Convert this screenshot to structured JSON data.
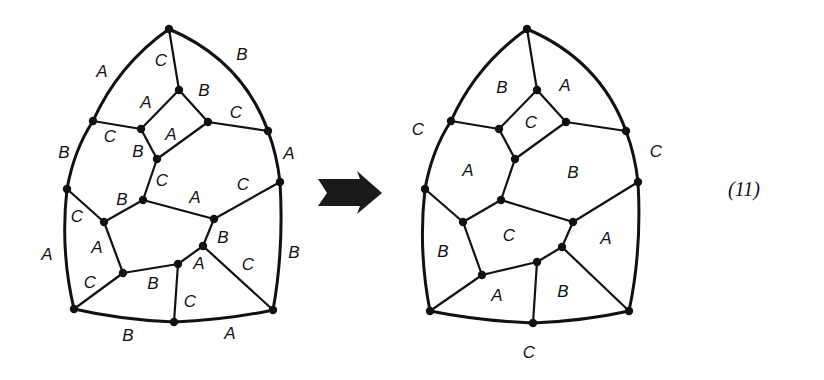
{
  "equation_label": "(11)",
  "arrow": {
    "direction": "right",
    "style": "stippled-block-arrow"
  },
  "left_diagram": {
    "description": "3-edge-colored cubic planar map; labels mark edge colors",
    "nodes": {
      "top": [
        169,
        29
      ],
      "it": [
        179,
        90
      ],
      "lu": [
        93,
        121
      ],
      "il": [
        141,
        129
      ],
      "ir": [
        208,
        122
      ],
      "ru": [
        268,
        131
      ],
      "sb": [
        157,
        159
      ],
      "rm": [
        280,
        182
      ],
      "lm": [
        67,
        189
      ],
      "c": [
        143,
        200
      ],
      "mr": [
        214,
        219
      ],
      "li": [
        104,
        222
      ],
      "pr": [
        203,
        246
      ],
      "pb": [
        178,
        264
      ],
      "ll": [
        123,
        273
      ],
      "bl": [
        74,
        309
      ],
      "bm": [
        174,
        322
      ],
      "br": [
        273,
        310
      ]
    },
    "edges": [
      [
        "top",
        "it"
      ],
      [
        "it",
        "il"
      ],
      [
        "it",
        "ir"
      ],
      [
        "lu",
        "il"
      ],
      [
        "il",
        "sb"
      ],
      [
        "ir",
        "sb"
      ],
      [
        "ir",
        "ru"
      ],
      [
        "sb",
        "c"
      ],
      [
        "lm",
        "li"
      ],
      [
        "li",
        "c"
      ],
      [
        "c",
        "mr"
      ],
      [
        "mr",
        "rm"
      ],
      [
        "mr",
        "pr"
      ],
      [
        "li",
        "ll"
      ],
      [
        "ll",
        "pb"
      ],
      [
        "pb",
        "pr"
      ],
      [
        "pr",
        "br"
      ],
      [
        "ll",
        "bl"
      ],
      [
        "pb",
        "bm"
      ]
    ],
    "outer": [
      [
        "top",
        "ru",
        "q",
        242,
        60
      ],
      [
        "ru",
        "rm",
        "q",
        277,
        155
      ],
      [
        "rm",
        "br",
        "q",
        284,
        250
      ],
      [
        "bl",
        "bm",
        "q",
        122,
        320
      ],
      [
        "bm",
        "br",
        "q",
        226,
        320
      ],
      [
        "lm",
        "bl",
        "q",
        60,
        250
      ],
      [
        "lu",
        "lm",
        "q",
        74,
        150
      ],
      [
        "top",
        "lu",
        "q",
        118,
        65
      ]
    ],
    "labels": [
      {
        "t": "A",
        "x": 102,
        "y": 73
      },
      {
        "t": "C",
        "x": 161,
        "y": 62
      },
      {
        "t": "B",
        "x": 242,
        "y": 56
      },
      {
        "t": "A",
        "x": 146,
        "y": 104
      },
      {
        "t": "B",
        "x": 204,
        "y": 92
      },
      {
        "t": "C",
        "x": 236,
        "y": 114
      },
      {
        "t": "C",
        "x": 110,
        "y": 138
      },
      {
        "t": "A",
        "x": 171,
        "y": 136
      },
      {
        "t": "B",
        "x": 138,
        "y": 153
      },
      {
        "t": "B",
        "x": 64,
        "y": 154
      },
      {
        "t": "A",
        "x": 289,
        "y": 155
      },
      {
        "t": "C",
        "x": 162,
        "y": 182
      },
      {
        "t": "B",
        "x": 122,
        "y": 201
      },
      {
        "t": "A",
        "x": 195,
        "y": 199
      },
      {
        "t": "C",
        "x": 243,
        "y": 186
      },
      {
        "t": "C",
        "x": 77,
        "y": 218
      },
      {
        "t": "A",
        "x": 97,
        "y": 249
      },
      {
        "t": "B",
        "x": 223,
        "y": 239
      },
      {
        "t": "A",
        "x": 47,
        "y": 256
      },
      {
        "t": "C",
        "x": 248,
        "y": 266
      },
      {
        "t": "B",
        "x": 294,
        "y": 254
      },
      {
        "t": "A",
        "x": 199,
        "y": 265
      },
      {
        "t": "C",
        "x": 90,
        "y": 284
      },
      {
        "t": "B",
        "x": 153,
        "y": 285
      },
      {
        "t": "C",
        "x": 190,
        "y": 303
      },
      {
        "t": "B",
        "x": 128,
        "y": 337
      },
      {
        "t": "A",
        "x": 230,
        "y": 335
      }
    ]
  },
  "right_diagram": {
    "description": "same map recolored with region (face) colors",
    "nodes": {
      "top": [
        527,
        29
      ],
      "it": [
        537,
        90
      ],
      "lu": [
        451,
        121
      ],
      "il": [
        499,
        129
      ],
      "ir": [
        566,
        122
      ],
      "ru": [
        626,
        131
      ],
      "sb": [
        515,
        159
      ],
      "rm": [
        638,
        182
      ],
      "lm": [
        425,
        189
      ],
      "c": [
        501,
        200
      ],
      "mr": [
        573,
        222
      ],
      "li": [
        463,
        222
      ],
      "pr": [
        562,
        247
      ],
      "pb": [
        537,
        262
      ],
      "ll": [
        482,
        275
      ],
      "bl": [
        430,
        311
      ],
      "bm": [
        533,
        323
      ],
      "br": [
        629,
        311
      ]
    },
    "edges": [
      [
        "top",
        "it"
      ],
      [
        "it",
        "il"
      ],
      [
        "it",
        "ir"
      ],
      [
        "lu",
        "il"
      ],
      [
        "il",
        "sb"
      ],
      [
        "ir",
        "sb"
      ],
      [
        "ir",
        "ru"
      ],
      [
        "sb",
        "c"
      ],
      [
        "lm",
        "li"
      ],
      [
        "li",
        "c"
      ],
      [
        "c",
        "mr"
      ],
      [
        "mr",
        "rm"
      ],
      [
        "mr",
        "pr"
      ],
      [
        "li",
        "ll"
      ],
      [
        "ll",
        "pb"
      ],
      [
        "pb",
        "pr"
      ],
      [
        "pr",
        "br"
      ],
      [
        "ll",
        "bl"
      ],
      [
        "pb",
        "bm"
      ]
    ],
    "outer": [
      [
        "top",
        "ru",
        "q",
        600,
        60
      ],
      [
        "ru",
        "rm",
        "q",
        635,
        155
      ],
      [
        "rm",
        "br",
        "q",
        642,
        250
      ],
      [
        "bl",
        "bm",
        "q",
        480,
        321
      ],
      [
        "bm",
        "br",
        "q",
        584,
        321
      ],
      [
        "lm",
        "bl",
        "q",
        418,
        250
      ],
      [
        "lu",
        "lm",
        "q",
        432,
        150
      ],
      [
        "top",
        "lu",
        "q",
        476,
        65
      ]
    ],
    "labels": [
      {
        "t": "B",
        "x": 502,
        "y": 89
      },
      {
        "t": "A",
        "x": 565,
        "y": 87
      },
      {
        "t": "C",
        "x": 531,
        "y": 124
      },
      {
        "t": "C",
        "x": 418,
        "y": 131
      },
      {
        "t": "A",
        "x": 468,
        "y": 172
      },
      {
        "t": "B",
        "x": 573,
        "y": 174
      },
      {
        "t": "C",
        "x": 656,
        "y": 153
      },
      {
        "t": "C",
        "x": 509,
        "y": 237
      },
      {
        "t": "A",
        "x": 606,
        "y": 240
      },
      {
        "t": "B",
        "x": 443,
        "y": 253
      },
      {
        "t": "A",
        "x": 497,
        "y": 297
      },
      {
        "t": "B",
        "x": 563,
        "y": 293
      },
      {
        "t": "C",
        "x": 529,
        "y": 354
      }
    ]
  }
}
